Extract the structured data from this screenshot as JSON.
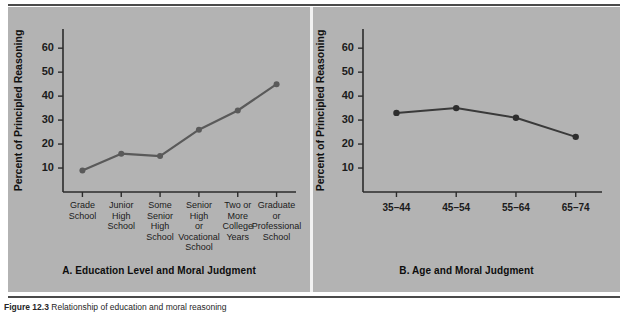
{
  "figure": {
    "caption_number": "Figure 12.3",
    "caption_text": "Relationship of education and moral reasoning"
  },
  "colors": {
    "plate_background": "#b3b3b3",
    "page_background": "#ffffff",
    "axis": "#2b2b2b",
    "series_a": "#5a5a5a",
    "series_b": "#2e2e2e",
    "divider": "#f2f2f2"
  },
  "panel_a": {
    "title": "A. Education Level and Moral Judgment",
    "ylabel": "Percent of Principled Reasoning"
  },
  "panel_b": {
    "title": "B. Age and Moral Judgment",
    "ylabel": "Percent of Principled Reasoning"
  },
  "chart_data": [
    {
      "type": "line",
      "panel": "A",
      "title": "A. Education Level and Moral Judgment",
      "xlabel": "",
      "ylabel": "Percent of Principled Reasoning",
      "ylim": [
        0,
        68
      ],
      "yticks": [
        10,
        20,
        30,
        40,
        50,
        60
      ],
      "ytick_labels": [
        "10",
        "20",
        "30",
        "40",
        "50",
        "60"
      ],
      "grid": false,
      "legend": "none",
      "categories": [
        "Grade School",
        "Junior High School",
        "Some Senior High School",
        "Senior High or Vocational School",
        "Two or More College Years",
        "Graduate or Professional School"
      ],
      "category_lines": [
        [
          "Grade",
          "School"
        ],
        [
          "Junior",
          "High",
          "School"
        ],
        [
          "Some",
          "Senior",
          "High",
          "School"
        ],
        [
          "Senior",
          "High",
          "or",
          "Vocational",
          "School"
        ],
        [
          "Two or",
          "More",
          "College",
          "Years"
        ],
        [
          "Graduate",
          "or",
          "Professional",
          "School"
        ]
      ],
      "values": [
        9,
        16,
        15,
        26,
        34,
        45
      ],
      "marker": "circle"
    },
    {
      "type": "line",
      "panel": "B",
      "title": "B. Age and Moral Judgment",
      "xlabel": "",
      "ylabel": "Percent of Principled Reasoning",
      "ylim": [
        0,
        68
      ],
      "yticks": [
        10,
        20,
        30,
        40,
        50,
        60
      ],
      "ytick_labels": [
        "10",
        "20",
        "30",
        "40",
        "50",
        "60"
      ],
      "grid": false,
      "legend": "none",
      "categories": [
        "35–44",
        "45–54",
        "55–64",
        "65–74"
      ],
      "values": [
        33,
        35,
        31,
        23
      ],
      "marker": "circle"
    }
  ]
}
